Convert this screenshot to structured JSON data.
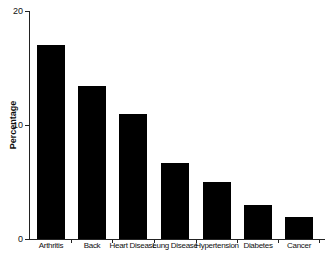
{
  "chart_data": {
    "type": "bar",
    "title": "",
    "xlabel": "",
    "ylabel": "Percentage",
    "ylim": [
      0,
      20
    ],
    "yticks": [
      0,
      10,
      20
    ],
    "grid": false,
    "categories": [
      "Arthritis",
      "Back",
      "Heart Disease",
      "Lung Disease",
      "Hypertension",
      "Diabetes",
      "Cancer"
    ],
    "values": [
      17.0,
      13.4,
      11.0,
      6.7,
      5.0,
      3.0,
      1.9
    ],
    "bar_color": "#000000"
  },
  "axis": {
    "ylabel": "Percentage",
    "yticks": [
      "0",
      "10",
      "20"
    ]
  },
  "bars": [
    {
      "label": "Arthritis",
      "value": 17.0
    },
    {
      "label": "Back",
      "value": 13.4
    },
    {
      "label": "Heart Disease",
      "value": 11.0
    },
    {
      "label": "Lung Disease",
      "value": 6.7
    },
    {
      "label": "Hypertension",
      "value": 5.0
    },
    {
      "label": "Diabetes",
      "value": 3.0
    },
    {
      "label": "Cancer",
      "value": 1.9
    }
  ]
}
